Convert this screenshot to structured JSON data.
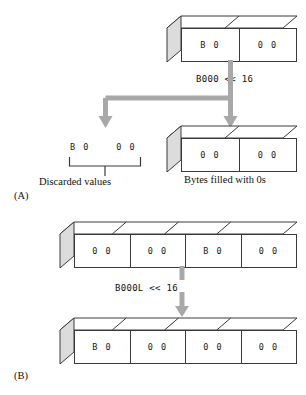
{
  "figure": {
    "panels": [
      {
        "id": "A",
        "label": "(A)",
        "source_box": {
          "name": "two-byte-source-box",
          "cells": [
            "B 0",
            "0 0"
          ]
        },
        "operation_label": "B000 << 16",
        "discarded": {
          "cells": [
            "B 0",
            "0 0"
          ],
          "caption": "Discarded values"
        },
        "result_box": {
          "name": "two-byte-result-box",
          "cells": [
            "0 0",
            "0 0"
          ],
          "caption": "Bytes filled with 0s"
        }
      },
      {
        "id": "B",
        "label": "(B)",
        "source_box": {
          "name": "four-byte-source-box",
          "cells": [
            "0 0",
            "0 0",
            "B 0",
            "0 0"
          ]
        },
        "operation_label": "B000L << 16",
        "result_box": {
          "name": "four-byte-result-box",
          "cells": [
            "B 0",
            "0 0",
            "0 0",
            "0 0"
          ]
        }
      }
    ]
  },
  "colors": {
    "arrow": "#a8a8a8",
    "box_outline": "#3a3a3a",
    "box_side_fill": "#dcdcdc",
    "box_top_fill": "#ffffff",
    "text": "#111111",
    "background": "#ffffff"
  }
}
